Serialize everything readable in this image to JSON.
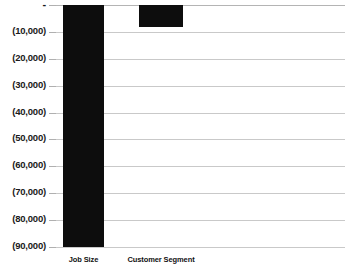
{
  "chart_data": {
    "type": "bar",
    "title": "",
    "subtitle": "",
    "xlabel": "",
    "ylabel": "",
    "categories": [
      "Job Size",
      "Customer Segment"
    ],
    "values": [
      -90000,
      -8000
    ],
    "series": [
      {
        "name": "",
        "values": [
          -90000,
          -8000
        ]
      }
    ],
    "ytick_labels": [
      "-",
      "(10,000)",
      "(20,000)",
      "(30,000)",
      "(40,000)",
      "(50,000)",
      "(60,000)",
      "(70,000)",
      "(80,000)",
      "(90,000)"
    ],
    "ytick_values": [
      0,
      -10000,
      -20000,
      -30000,
      -40000,
      -50000,
      -60000,
      -70000,
      -80000,
      -90000
    ],
    "ylim": [
      -90000,
      0
    ],
    "grid": true,
    "legend": false,
    "bar_color": "#0d0d0d",
    "gridline_color": "#c9c9c9",
    "background_color": "#ffffff",
    "number_format": "accounting-parentheses-negative"
  }
}
